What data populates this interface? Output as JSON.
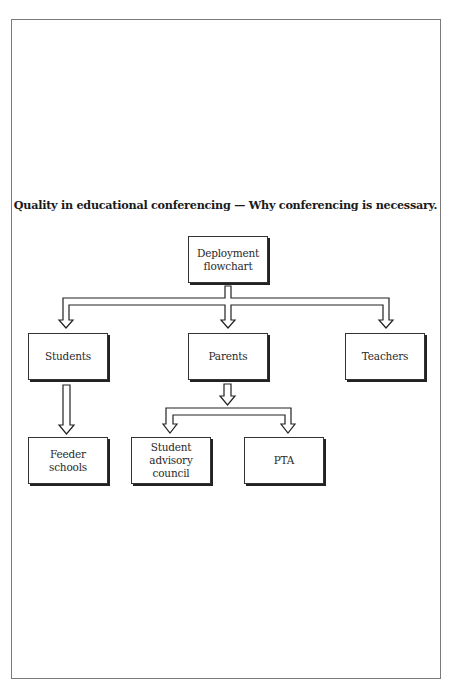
{
  "diagram": {
    "title": "Quality in educational conferencing — Why conferencing is necessary.",
    "type": "hierarchical flowchart",
    "nodes": {
      "root": "Deployment\nflowchart",
      "students": "Students",
      "parents": "Parents",
      "teachers": "Teachers",
      "feeder_schools": "Feeder\nschools",
      "student_advisory_council": "Student\nadvisory\ncouncil",
      "pta": "PTA"
    },
    "edges": [
      {
        "from": "Deployment flowchart",
        "to": "Students"
      },
      {
        "from": "Deployment flowchart",
        "to": "Parents"
      },
      {
        "from": "Deployment flowchart",
        "to": "Teachers"
      },
      {
        "from": "Students",
        "to": "Feeder schools"
      },
      {
        "from": "Parents",
        "to": "Student advisory council"
      },
      {
        "from": "Parents",
        "to": "PTA"
      }
    ],
    "colors": {
      "border": "#222222",
      "background": "#ffffff",
      "frame": "#7a7a7a"
    }
  }
}
